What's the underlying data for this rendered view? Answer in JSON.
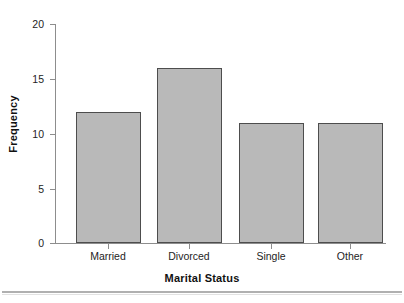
{
  "chart_data": {
    "type": "bar",
    "title": "",
    "categories": [
      "Married",
      "Divorced",
      "Single",
      "Other"
    ],
    "values": [
      12,
      16,
      11,
      11
    ],
    "xlabel": "Marital Status",
    "ylabel": "Frequency",
    "ylim": [
      0,
      20
    ],
    "yticks": [
      0,
      5,
      10,
      15,
      20
    ],
    "ytick_labels": [
      "0",
      "5",
      "10",
      "15",
      "20"
    ],
    "grid": false,
    "legend": false,
    "bar_color": "#b9b9b9",
    "bar_border_color": "#4d4d4d",
    "axis_color": "#8d8d8d",
    "text_color": "#242424"
  },
  "axis": {
    "y_title": "Frequency",
    "x_title": "Marital Status"
  },
  "ticks": {
    "y": [
      {
        "label": "20",
        "value": 20
      },
      {
        "label": "15",
        "value": 15
      },
      {
        "label": "10",
        "value": 10
      },
      {
        "label": "5",
        "value": 5
      },
      {
        "label": "0",
        "value": 0
      }
    ]
  },
  "bars": [
    {
      "label": "Married",
      "value": 12
    },
    {
      "label": "Divorced",
      "value": 16
    },
    {
      "label": "Single",
      "value": 11
    },
    {
      "label": "Other",
      "value": 11
    }
  ]
}
